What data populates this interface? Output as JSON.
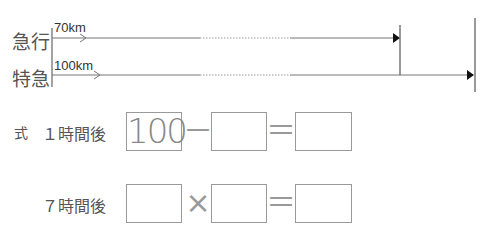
{
  "diagram": {
    "rows": [
      {
        "train": "急行",
        "distance_label": "70km"
      },
      {
        "train": "特急",
        "distance_label": "100km"
      }
    ]
  },
  "formula": {
    "prefix": "式",
    "rows": [
      {
        "label": "１時間後",
        "box1": "100",
        "op1": "－",
        "box2": "",
        "op2": "＝",
        "box3": ""
      },
      {
        "label": "７時間後",
        "box1": "",
        "op1": "×",
        "box2": "",
        "op2": "＝",
        "box3": ""
      }
    ]
  }
}
